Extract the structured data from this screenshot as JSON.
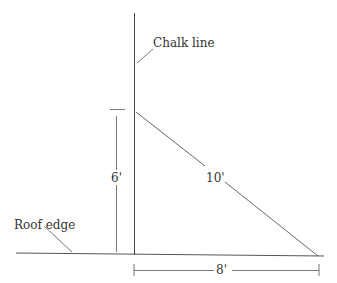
{
  "diagram": {
    "labels": {
      "chalk_line": "Chalk line",
      "roof_edge": "Roof edge",
      "height": "6'",
      "hypotenuse": "10'",
      "base": "8'"
    },
    "colors": {
      "line": "#444444",
      "text": "#333333",
      "background": "#ffffff"
    }
  }
}
